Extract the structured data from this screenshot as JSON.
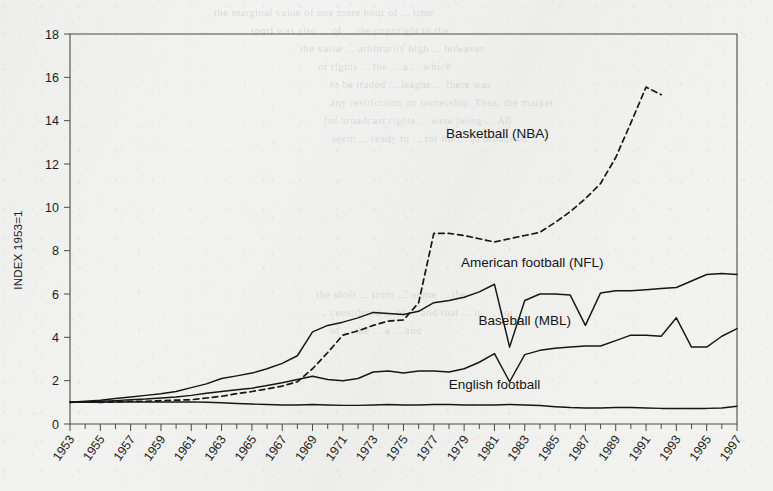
{
  "page": {
    "background_color": "#f2f2f1",
    "ink_color": "#161616"
  },
  "ghost_text": [
    {
      "text": "the marginal value of one more hour of ... time",
      "x": 214,
      "y": 6
    },
    {
      "text": "sport was also ... of ... the copyright to the",
      "x": 250,
      "y": 24
    },
    {
      "text": "the value ... arbitrarily high ... however",
      "x": 300,
      "y": 42
    },
    {
      "text": "of rights ... the ... a ... which",
      "x": 318,
      "y": 60
    },
    {
      "text": "to be traded ... league ... there was",
      "x": 330,
      "y": 78
    },
    {
      "text": "any restrictions on ownership. Thus, the market",
      "x": 330,
      "y": 96
    },
    {
      "text": "for broadcast rights ... were being ... All",
      "x": 324,
      "y": 114
    },
    {
      "text": "seem ... ready to ... for the ... to broadcast",
      "x": 332,
      "y": 132
    },
    {
      "text": "the most ... from .... some ... the",
      "x": 316,
      "y": 288
    },
    {
      "text": "... considered ... of ... and that ... in ... not",
      "x": 318,
      "y": 306
    },
    {
      "text": "of ... the ... a ... and",
      "x": 330,
      "y": 324
    }
  ],
  "chart_data": {
    "type": "line",
    "title": "",
    "xlabel": "",
    "ylabel": "INDEX 1953=1",
    "xlim": [
      1953,
      1997
    ],
    "ylim": [
      0,
      18
    ],
    "ytick_step": 2,
    "xtick_step": 2,
    "grid": false,
    "legend_position": "inline-annotations",
    "yticks": [
      0,
      2,
      4,
      6,
      8,
      10,
      12,
      14,
      16,
      18
    ],
    "xticks": [
      1953,
      1955,
      1957,
      1959,
      1961,
      1963,
      1965,
      1967,
      1969,
      1971,
      1973,
      1975,
      1977,
      1979,
      1981,
      1983,
      1985,
      1987,
      1989,
      1991,
      1993,
      1995,
      1997
    ],
    "x": [
      1953,
      1954,
      1955,
      1956,
      1957,
      1958,
      1959,
      1960,
      1961,
      1962,
      1963,
      1964,
      1965,
      1966,
      1967,
      1968,
      1969,
      1970,
      1971,
      1972,
      1973,
      1974,
      1975,
      1976,
      1977,
      1978,
      1979,
      1980,
      1981,
      1982,
      1983,
      1984,
      1985,
      1986,
      1987,
      1988,
      1989,
      1990,
      1991,
      1992,
      1993,
      1994,
      1995,
      1996,
      1997
    ],
    "series": [
      {
        "name": "Basketball (NBA)",
        "style": "dashed",
        "label_x": 1981.2,
        "label_y": 13.2,
        "values": [
          1.0,
          1.02,
          1.0,
          1.02,
          1.05,
          1.05,
          1.08,
          1.1,
          1.12,
          1.2,
          1.28,
          1.4,
          1.5,
          1.62,
          1.75,
          1.95,
          2.55,
          3.3,
          4.1,
          4.3,
          4.55,
          4.75,
          4.8,
          5.6,
          8.8,
          8.8,
          8.7,
          8.55,
          8.4,
          8.55,
          8.7,
          8.85,
          9.3,
          9.8,
          10.4,
          11.1,
          12.3,
          13.9,
          15.55,
          15.2,
          null,
          null,
          null,
          null,
          null
        ]
      },
      {
        "name": "American football (NFL)",
        "style": "solid",
        "label_x": 1983.5,
        "label_y": 7.25,
        "values": [
          1.0,
          1.05,
          1.1,
          1.18,
          1.25,
          1.32,
          1.4,
          1.5,
          1.68,
          1.85,
          2.1,
          2.22,
          2.35,
          2.55,
          2.8,
          3.15,
          4.25,
          4.55,
          4.7,
          4.9,
          5.15,
          5.1,
          5.05,
          5.2,
          5.6,
          5.7,
          5.85,
          6.1,
          6.45,
          3.55,
          5.7,
          6.0,
          6.0,
          5.95,
          4.55,
          6.05,
          6.15,
          6.15,
          6.2,
          6.25,
          6.3,
          6.6,
          6.9,
          6.95,
          6.9
        ]
      },
      {
        "name": "Baseball (MBL)",
        "style": "solid",
        "label_x": 1983.0,
        "label_y": 4.55,
        "values": [
          1.0,
          1.02,
          1.05,
          1.08,
          1.12,
          1.15,
          1.2,
          1.25,
          1.32,
          1.42,
          1.5,
          1.58,
          1.65,
          1.78,
          1.9,
          2.05,
          2.2,
          2.05,
          2.0,
          2.1,
          2.4,
          2.45,
          2.35,
          2.45,
          2.45,
          2.4,
          2.55,
          2.85,
          3.25,
          1.95,
          3.2,
          3.4,
          3.5,
          3.55,
          3.6,
          3.6,
          3.85,
          4.1,
          4.1,
          4.05,
          4.9,
          3.55,
          3.55,
          4.05,
          4.4
        ]
      },
      {
        "name": "English football",
        "style": "solid",
        "label_x": 1981.0,
        "label_y": 1.6,
        "values": [
          1.0,
          1.0,
          1.0,
          1.02,
          1.02,
          1.02,
          1.02,
          1.02,
          1.02,
          1.0,
          0.98,
          0.95,
          0.92,
          0.9,
          0.88,
          0.88,
          0.9,
          0.88,
          0.86,
          0.86,
          0.88,
          0.9,
          0.88,
          0.88,
          0.9,
          0.9,
          0.88,
          0.88,
          0.88,
          0.9,
          0.88,
          0.85,
          0.8,
          0.76,
          0.74,
          0.74,
          0.76,
          0.76,
          0.74,
          0.72,
          0.72,
          0.72,
          0.72,
          0.74,
          0.82
        ]
      }
    ]
  }
}
